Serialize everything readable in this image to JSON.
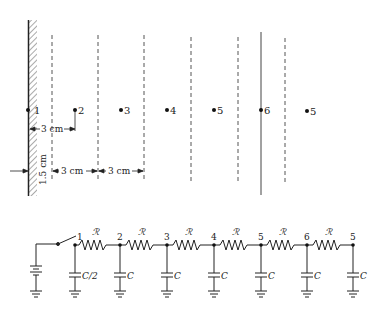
{
  "field_diagram": {
    "points": [
      {
        "label": "1",
        "x": 28
      },
      {
        "label": "2",
        "x": 75
      },
      {
        "label": "3",
        "x": 121
      },
      {
        "label": "4",
        "x": 167
      },
      {
        "label": "5",
        "x": 214
      },
      {
        "label": "6",
        "x": 261
      },
      {
        "label": "5",
        "x": 307
      }
    ],
    "dashed_lines_x": [
      52,
      98,
      144,
      191,
      238,
      285
    ],
    "solid_line_x": 261,
    "dimensions": {
      "wall_to_point2": "3 cm",
      "wall_to_first_dashed": "1.5 cm",
      "spacing_a": "3 cm",
      "spacing_b": "3 cm"
    }
  },
  "circuit": {
    "resistor_label": "ℛ",
    "nodes": [
      {
        "label": "1",
        "x": 75,
        "cap": "C/2"
      },
      {
        "label": "2",
        "x": 120,
        "cap": "C"
      },
      {
        "label": "3",
        "x": 167,
        "cap": "C"
      },
      {
        "label": "4",
        "x": 214,
        "cap": "C"
      },
      {
        "label": "5",
        "x": 261,
        "cap": "C"
      },
      {
        "label": "6",
        "x": 307,
        "cap": "C"
      },
      {
        "label": "5",
        "x": 353,
        "cap": "C"
      }
    ]
  }
}
